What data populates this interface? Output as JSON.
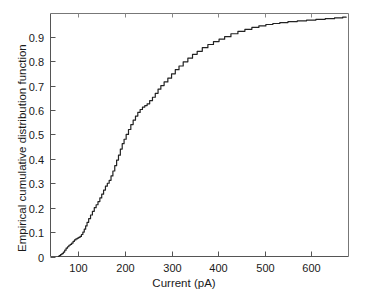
{
  "chart_data": {
    "type": "line",
    "title": "",
    "xlabel": "Current (pA)",
    "ylabel": "Empirical cumulative distribution function",
    "xlim": [
      40,
      680
    ],
    "ylim": [
      0,
      0.995
    ],
    "grid": false,
    "legend": null,
    "xticks": [
      100,
      200,
      300,
      400,
      500,
      600
    ],
    "xtick_labels": [
      "100",
      "200",
      "300",
      "400",
      "500",
      "600"
    ],
    "yticks": [
      0,
      0.1,
      0.2,
      0.3,
      0.4,
      0.5,
      0.6,
      0.7,
      0.8,
      0.9
    ],
    "ytick_labels": [
      "0",
      "0.1",
      "0.2",
      "0.3",
      "0.4",
      "0.5",
      "0.6",
      "0.7",
      "0.8",
      "0.9"
    ],
    "line_color": "#222222",
    "line_width": 1.2,
    "series": [
      {
        "name": "Empirical CDF of current",
        "x": [
          57,
          60,
          63,
          66,
          69,
          72,
          75,
          78,
          81,
          84,
          87,
          90,
          93,
          96,
          99,
          102,
          105,
          108,
          111,
          114,
          117,
          120,
          124,
          128,
          132,
          136,
          140,
          144,
          148,
          152,
          156,
          160,
          164,
          168,
          172,
          176,
          180,
          184,
          188,
          192,
          196,
          200,
          205,
          210,
          215,
          220,
          225,
          230,
          235,
          240,
          245,
          250,
          256,
          262,
          268,
          274,
          280,
          288,
          296,
          304,
          312,
          320,
          330,
          340,
          350,
          360,
          372,
          384,
          396,
          408,
          420,
          435,
          450,
          465,
          480,
          495,
          510,
          525,
          540,
          560,
          580,
          600,
          620,
          640,
          660,
          675
        ],
        "y": [
          0.0,
          0.004,
          0.008,
          0.012,
          0.018,
          0.026,
          0.034,
          0.04,
          0.046,
          0.05,
          0.055,
          0.062,
          0.068,
          0.072,
          0.075,
          0.078,
          0.082,
          0.09,
          0.1,
          0.112,
          0.125,
          0.14,
          0.155,
          0.17,
          0.185,
          0.2,
          0.212,
          0.225,
          0.24,
          0.255,
          0.272,
          0.288,
          0.3,
          0.312,
          0.33,
          0.35,
          0.372,
          0.395,
          0.415,
          0.44,
          0.462,
          0.48,
          0.5,
          0.52,
          0.54,
          0.558,
          0.575,
          0.59,
          0.602,
          0.612,
          0.618,
          0.625,
          0.638,
          0.652,
          0.668,
          0.685,
          0.7,
          0.715,
          0.73,
          0.748,
          0.765,
          0.78,
          0.797,
          0.812,
          0.828,
          0.84,
          0.855,
          0.868,
          0.88,
          0.89,
          0.9,
          0.912,
          0.922,
          0.93,
          0.938,
          0.944,
          0.95,
          0.954,
          0.958,
          0.962,
          0.965,
          0.968,
          0.971,
          0.974,
          0.977,
          0.98
        ]
      }
    ]
  }
}
